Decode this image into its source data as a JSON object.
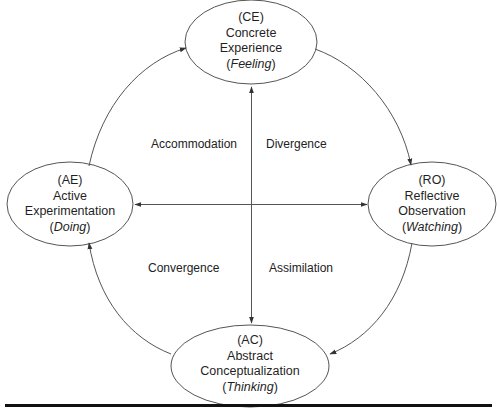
{
  "diagram": {
    "nodes": [
      {
        "id": "CE",
        "code": "(CE)",
        "line1": "Concrete",
        "line2": "Experience",
        "mode": "Feeling"
      },
      {
        "id": "RO",
        "code": "(RO)",
        "line1": "Reflective",
        "line2": "Observation",
        "mode": "Watching"
      },
      {
        "id": "AC",
        "code": "(AC)",
        "line1": "Abstract",
        "line2": "Conceptualization",
        "mode": "Thinking"
      },
      {
        "id": "AE",
        "code": "(AE)",
        "line1": "Active",
        "line2": "Experimentation",
        "mode": "Doing"
      }
    ],
    "quadrants": {
      "top_left": "Accommodation",
      "top_right": "Divergence",
      "bottom_left": "Convergence",
      "bottom_right": "Assimilation"
    },
    "edges": [
      {
        "from": "CE",
        "to": "RO",
        "type": "cycle"
      },
      {
        "from": "RO",
        "to": "AC",
        "type": "cycle"
      },
      {
        "from": "AC",
        "to": "AE",
        "type": "cycle"
      },
      {
        "from": "AE",
        "to": "CE",
        "type": "cycle"
      },
      {
        "from": "CE",
        "to": "AC",
        "type": "bidirectional-axis"
      },
      {
        "from": "AE",
        "to": "RO",
        "type": "bidirectional-axis"
      }
    ],
    "colors": {
      "stroke": "#444444",
      "text": "#1f1f1f",
      "bar": "#111111"
    }
  }
}
